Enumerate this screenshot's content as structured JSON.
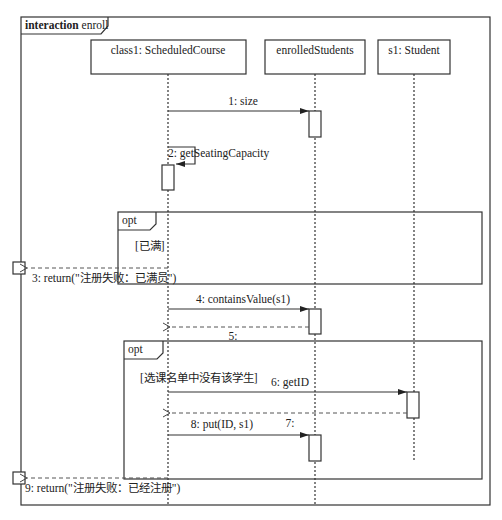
{
  "frame": {
    "keyword": "interaction",
    "name": "enroll"
  },
  "lifelines": [
    {
      "label": "class1: ScheduledCourse"
    },
    {
      "label": "enrolledStudents"
    },
    {
      "label": "s1: Student"
    }
  ],
  "messages": [
    {
      "label": "1: size"
    },
    {
      "label": "2: getSeatingCapacity"
    },
    {
      "label": "3: return(\"注册失败：已满员\")"
    },
    {
      "label": "4: containsValue(s1)"
    },
    {
      "label": "5:"
    },
    {
      "label": "6: getID"
    },
    {
      "label": "7:"
    },
    {
      "label": "8: put(ID, s1)"
    },
    {
      "label": "9: return(\"注册失败：已经注册\")"
    }
  ],
  "fragments": [
    {
      "operator": "opt",
      "guard": "[已满]"
    },
    {
      "operator": "opt",
      "guard": "[选课名单中没有该学生]"
    }
  ]
}
